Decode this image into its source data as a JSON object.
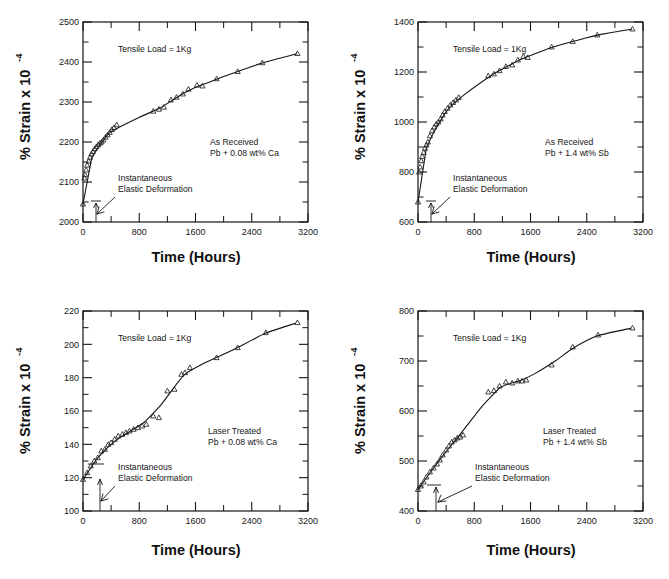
{
  "figure": {
    "name": "creep-curves-lead-alloys",
    "panel_count": 4,
    "caption_partial": "",
    "ink_color": "#151515",
    "background_color": "#ffffff"
  },
  "common": {
    "xlabel": "Time (Hours)",
    "ylabel_main": "% Strain x 10",
    "ylabel_exponent": "-4",
    "load_annotation": "Tensile Load = 1Kg",
    "arrow_annotation_line1": "Instantaneous",
    "arrow_annotation_line2": "Elastic Deformation",
    "xticks": [
      0,
      800,
      1600,
      2400,
      3200
    ],
    "xticklabels": [
      "0",
      "800",
      "1600",
      "2400",
      "3200"
    ],
    "xlim": [
      0,
      3200
    ],
    "grid": false,
    "legend": "none",
    "marker": "triangle-up-open"
  },
  "chart_data": [
    {
      "id": "panel-tl",
      "position": "top-left",
      "type": "scatter",
      "title": "",
      "condition_line1": "As Received",
      "condition_line2": "Pb + 0.08 wt% Ca",
      "xlabel": "Time (Hours)",
      "ylabel": "% Strain x 10^-4",
      "xlim": [
        0,
        3200
      ],
      "ylim": [
        2000,
        2500
      ],
      "yticks": [
        2000,
        2100,
        2200,
        2300,
        2400,
        2500
      ],
      "yticklabels": [
        "2000",
        "2100",
        "2200",
        "2300",
        "2400",
        "2500"
      ],
      "x": [
        0,
        20,
        30,
        45,
        60,
        80,
        100,
        120,
        140,
        165,
        190,
        215,
        240,
        265,
        290,
        320,
        350,
        380,
        410,
        440,
        480,
        1000,
        1080,
        1150,
        1250,
        1330,
        1420,
        1500,
        1620,
        1700,
        1900,
        2200,
        2550,
        3050
      ],
      "y": [
        2045,
        2110,
        2118,
        2130,
        2142,
        2152,
        2162,
        2170,
        2176,
        2183,
        2188,
        2193,
        2197,
        2200,
        2205,
        2212,
        2218,
        2224,
        2231,
        2236,
        2243,
        2277,
        2282,
        2287,
        2305,
        2312,
        2320,
        2332,
        2342,
        2340,
        2358,
        2376,
        2398,
        2421
      ],
      "initial_elastic_strain": 2045,
      "notes": "Primary creep rises sharply then transitions to near-logarithmic secondary creep."
    },
    {
      "id": "panel-tr",
      "position": "top-right",
      "type": "scatter",
      "title": "",
      "condition_line1": "As Received",
      "condition_line2": "Pb + 1.4 wt% Sb",
      "xlabel": "Time (Hours)",
      "ylabel": "% Strain x 10^-4",
      "xlim": [
        0,
        3200
      ],
      "ylim": [
        600,
        1400
      ],
      "yticks": [
        600,
        800,
        1000,
        1200,
        1400
      ],
      "yticklabels": [
        "600",
        "800",
        "1000",
        "1200",
        "1400"
      ],
      "x": [
        0,
        15,
        30,
        45,
        60,
        80,
        100,
        120,
        140,
        170,
        200,
        230,
        260,
        290,
        320,
        350,
        380,
        420,
        460,
        500,
        540,
        580,
        1000,
        1080,
        1160,
        1250,
        1340,
        1420,
        1500,
        1560,
        1900,
        2200,
        2550,
        3050
      ],
      "y": [
        680,
        800,
        820,
        845,
        862,
        878,
        895,
        908,
        920,
        945,
        965,
        980,
        992,
        1000,
        1012,
        1028,
        1042,
        1055,
        1068,
        1078,
        1088,
        1098,
        1185,
        1192,
        1205,
        1222,
        1228,
        1248,
        1262,
        1258,
        1300,
        1322,
        1348,
        1372
      ],
      "initial_elastic_strain": 680,
      "notes": "Similar creep shape as Pb+Ca as-received but lower absolute strain scale."
    },
    {
      "id": "panel-bl",
      "position": "bottom-left",
      "type": "scatter",
      "title": "",
      "condition_line1": "Laser Treated",
      "condition_line2": "Pb + 0.08 wt% Ca",
      "xlabel": "Time (Hours)",
      "ylabel": "% Strain x 10^-4",
      "xlim": [
        0,
        3200
      ],
      "ylim": [
        100,
        220
      ],
      "yticks": [
        100,
        120,
        140,
        160,
        180,
        200,
        220
      ],
      "yticklabels": [
        "100",
        "120",
        "140",
        "160",
        "180",
        "200",
        "220"
      ],
      "x": [
        0,
        60,
        110,
        160,
        210,
        260,
        310,
        360,
        400,
        450,
        500,
        560,
        610,
        660,
        720,
        780,
        840,
        900,
        1000,
        1080,
        1200,
        1300,
        1400,
        1450,
        1520,
        1900,
        2200,
        2600,
        3050
      ],
      "y": [
        119,
        123,
        127,
        130,
        132,
        136,
        137,
        140,
        141,
        143,
        145,
        146,
        147,
        148,
        149,
        150,
        151,
        152,
        157,
        156,
        172,
        173,
        182,
        183,
        186,
        192,
        198,
        207,
        213
      ],
      "initial_elastic_strain": 119,
      "notes": "Sigmoidal: primary creep, plateau near 150, accelerating stage near 1000-1500 h, then steady rise."
    },
    {
      "id": "panel-br",
      "position": "bottom-right",
      "type": "scatter",
      "title": "",
      "condition_line1": "Laser Treated",
      "condition_line2": "Pb + 1.4 wt% Sb",
      "xlabel": "Time (Hours)",
      "ylabel": "% Strain x 10^-4",
      "xlim": [
        0,
        3200
      ],
      "ylim": [
        400,
        800
      ],
      "yticks": [
        400,
        500,
        600,
        700,
        800
      ],
      "yticklabels": [
        "400",
        "500",
        "600",
        "700",
        "800"
      ],
      "x": [
        0,
        40,
        80,
        120,
        170,
        220,
        270,
        310,
        350,
        400,
        440,
        480,
        520,
        560,
        600,
        640,
        1000,
        1080,
        1160,
        1250,
        1340,
        1420,
        1480,
        1540,
        1900,
        2200,
        2560,
        3050
      ],
      "y": [
        443,
        450,
        458,
        468,
        478,
        486,
        494,
        502,
        512,
        522,
        530,
        538,
        542,
        546,
        548,
        552,
        638,
        641,
        650,
        658,
        656,
        660,
        660,
        662,
        692,
        728,
        752,
        766
      ],
      "initial_elastic_strain": 443,
      "notes": "Near-linear primary-secondary rise, inflection near 1000 h, tertiary flattening after 2500 h."
    }
  ]
}
